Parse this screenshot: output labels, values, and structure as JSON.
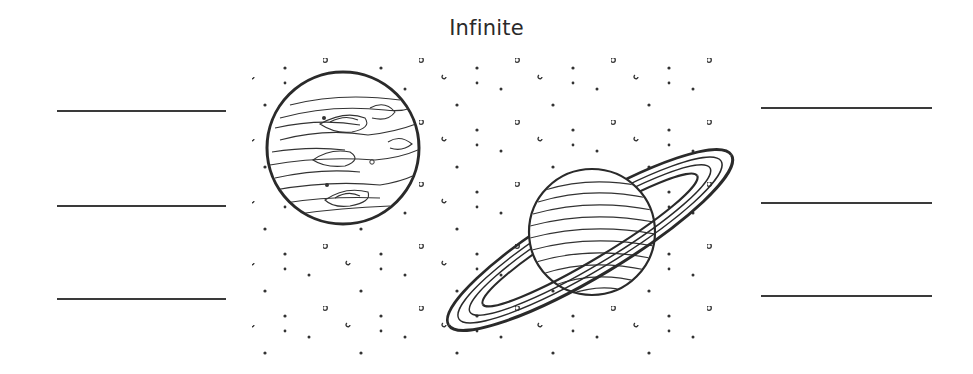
{
  "worksheet": {
    "title": "Infinite",
    "left_answer_lines": [
      {
        "x1": 57,
        "x2": 226,
        "y": 111
      },
      {
        "x1": 57,
        "x2": 226,
        "y": 206
      },
      {
        "x1": 57,
        "x2": 226,
        "y": 299
      }
    ],
    "right_answer_lines": [
      {
        "x1": 761,
        "x2": 932,
        "y": 108
      },
      {
        "x1": 761,
        "x2": 932,
        "y": 203
      },
      {
        "x1": 761,
        "x2": 932,
        "y": 296
      }
    ],
    "illustration": {
      "description": "Line drawing of Jupiter and ringed Saturn in a starry sky",
      "planets": [
        {
          "name": "jupiter",
          "cx": 343,
          "cy": 148,
          "r": 76
        },
        {
          "name": "saturn",
          "cx": 592,
          "cy": 232,
          "r": 63,
          "ring_rotation_deg": -31
        }
      ],
      "star_field": {
        "x_start": 258,
        "x_end": 722,
        "y_start": 57,
        "y_end": 355,
        "tile_w": 96,
        "tile_h": 62
      }
    },
    "colors": {
      "ink": "#2a2a2a",
      "line": "#3a3a3a",
      "background": "#ffffff"
    }
  }
}
